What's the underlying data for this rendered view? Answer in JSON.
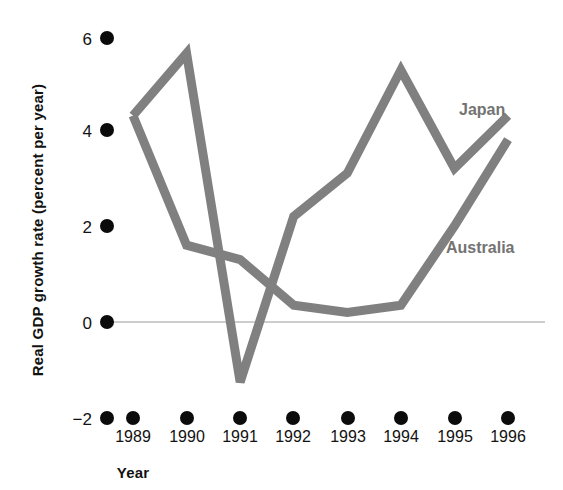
{
  "chart_data": {
    "type": "line",
    "title": "",
    "subtitle": "",
    "xlabel": "Year",
    "ylabel": "Real GDP growth rate (percent per year)",
    "categories": [
      "1989",
      "1990",
      "1991",
      "1992",
      "1993",
      "1994",
      "1995",
      "1996"
    ],
    "x": [
      1989,
      1990,
      1991,
      1992,
      1993,
      1994,
      1995,
      1996
    ],
    "xlim": [
      1989,
      1996
    ],
    "ylim": [
      -2,
      6
    ],
    "yticks": [
      -2,
      0,
      2,
      4,
      6
    ],
    "ytick_labels": [
      "−2",
      "0",
      "2",
      "4",
      "6"
    ],
    "grid": false,
    "zero_line": true,
    "legend_position": "inline-right",
    "series": [
      {
        "name": "Japan",
        "color": "#808080",
        "values": [
          4.3,
          5.6,
          -1.25,
          2.2,
          3.1,
          5.25,
          3.2,
          4.3
        ],
        "label_x": 1995.15,
        "label_y": 4.55
      },
      {
        "name": "Australia",
        "color": "#808080",
        "values": [
          4.3,
          1.6,
          1.3,
          0.35,
          0.2,
          0.35,
          2.0,
          3.8
        ],
        "label_x": 1995.05,
        "label_y": 1.65
      }
    ],
    "annotations": [
      {
        "text": "Japan",
        "series": "Japan"
      },
      {
        "text": "Australia",
        "series": "Australia"
      }
    ]
  },
  "axes": {
    "y_axis_title": "Real GDP growth rate (percent per year)",
    "x_axis_title": "Year"
  },
  "colors": {
    "line": "#808080",
    "tick_dot": "#0b0b0b",
    "zero_line": "#bdbdbd",
    "text": "#121212",
    "series_label": "#737373",
    "background": "#ffffff"
  }
}
